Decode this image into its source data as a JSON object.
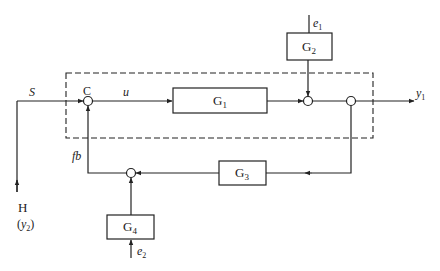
{
  "diagram": {
    "type": "block-diagram",
    "boundary": "dashed",
    "blocks": [
      {
        "id": "G1",
        "label": "G",
        "sub": "1"
      },
      {
        "id": "G2",
        "label": "G",
        "sub": "2"
      },
      {
        "id": "G3",
        "label": "G",
        "sub": "3"
      },
      {
        "id": "G4",
        "label": "G",
        "sub": "4"
      }
    ],
    "signals": {
      "S": "S",
      "C": "C",
      "u": "u",
      "e1": {
        "base": "e",
        "sub": "1"
      },
      "e2": {
        "base": "e",
        "sub": "2"
      },
      "y1": {
        "base": "y",
        "sub": "1"
      },
      "fb": "fb",
      "H": "H",
      "y2": {
        "open": "(",
        "base": "y",
        "sub": "2",
        "close": ")"
      }
    }
  }
}
